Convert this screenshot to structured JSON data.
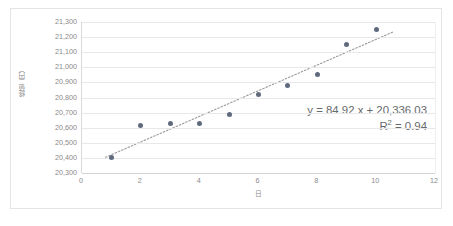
{
  "chart_data": {
    "type": "scatter",
    "title": "",
    "xlabel": "日",
    "ylabel": "終値（円）",
    "xlim": [
      0,
      12
    ],
    "ylim": [
      20300,
      21300
    ],
    "ytick_step": 100,
    "grid": true,
    "legend": "none",
    "x": [
      1,
      2,
      3,
      4,
      5,
      6,
      7,
      8,
      9,
      10
    ],
    "values": [
      20400,
      20615,
      20625,
      20625,
      20690,
      20820,
      20880,
      20950,
      21150,
      21250
    ],
    "series": [
      {
        "name": "終値（円）",
        "x": [
          1,
          2,
          3,
          4,
          5,
          6,
          7,
          8,
          9,
          10
        ],
        "values": [
          20400,
          20615,
          20625,
          20625,
          20690,
          20820,
          20880,
          20950,
          21150,
          21250
        ],
        "marker_color": "#5f6a7d"
      }
    ],
    "xtick_labels": [
      "0",
      "2",
      "4",
      "6",
      "8",
      "10",
      "12"
    ],
    "xticks": [
      0,
      2,
      4,
      6,
      8,
      10,
      12
    ],
    "ytick_labels": [
      "21,300",
      "21,200",
      "21,100",
      "21,000",
      "20,900",
      "20,800",
      "20,700",
      "20,600",
      "20,500",
      "20,400",
      "20,300"
    ],
    "yticks": [
      21300,
      21200,
      21100,
      21000,
      20900,
      20800,
      20700,
      20600,
      20500,
      20400,
      20300
    ],
    "trendline": {
      "type": "linear",
      "slope": 84.92,
      "intercept": 20336.03,
      "r_squared": 0.94,
      "style": "dotted",
      "color": "#9a9a9a",
      "x_start": 0.8,
      "x_end": 10.6,
      "equation_label": "y = 84.92 x + 20,336.03",
      "r2_label_prefix": "R",
      "r2_label_sup": "2",
      "r2_label_suffix": " = 0.94"
    },
    "colors": {
      "marker": "#5f6a7d",
      "trendline": "#9a9a9a",
      "gridline": "#e8e8e8",
      "axis": "#d4d4d4",
      "text": "#8a8a8a",
      "annotation_text": "#666a6d",
      "frame_border": "#e4e4e4",
      "background": "#ffffff"
    }
  }
}
